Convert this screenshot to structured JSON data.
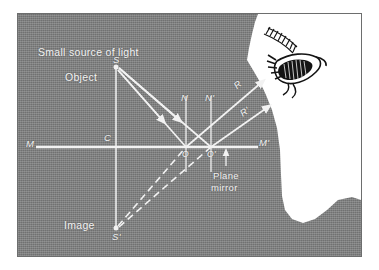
{
  "figure": {
    "title_caption": "Reflection of light from a plane mirror",
    "background_color": "#7f8080",
    "ink_color": "#f2f2f2",
    "silhouette_color": "#ffffff"
  },
  "labels": {
    "source": "Small source of light",
    "object": "Object",
    "object_point": "S",
    "center": "C",
    "mirror_left": "M",
    "mirror_right": "M'",
    "normal_1": "N",
    "normal_2": "N'",
    "ray_1": "R",
    "ray_2": "R'",
    "origin_1": "O",
    "origin_2": "O'",
    "image": "Image",
    "image_point": "S'",
    "plane_mirror_line1": "Plane",
    "plane_mirror_line2": "mirror"
  },
  "icons": {
    "eye": "eye-icon",
    "eyebrow": "eyebrow-icon",
    "face": "face-silhouette-icon",
    "mirror_pointer": "up-arrow-icon"
  },
  "geometry": {
    "object_S": [
      116,
      67
    ],
    "image_S": [
      116,
      228
    ],
    "center_C": [
      116,
      147
    ],
    "mirror_y": 147,
    "mirror_x_start": 36,
    "mirror_x_end": 258,
    "hit_O": [
      186,
      147
    ],
    "hit_O2": [
      211,
      147
    ],
    "ray_R_end": [
      262,
      82
    ],
    "ray_R2_end": [
      268,
      107
    ]
  }
}
